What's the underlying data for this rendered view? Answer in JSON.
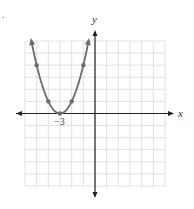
{
  "problem_marker": ".",
  "chart_data": {
    "type": "line",
    "title": "",
    "xlabel": "x",
    "ylabel": "y",
    "xlim": [
      -6,
      6
    ],
    "ylim": [
      -6,
      6
    ],
    "grid": true,
    "function": "y = (x + 3)^2",
    "vertex": {
      "x": -3,
      "y": 0,
      "label": "−3"
    },
    "series": [
      {
        "name": "parabola",
        "color": "#6b6b6b",
        "points": [
          {
            "x": -5,
            "y": 4
          },
          {
            "x": -4,
            "y": 1
          },
          {
            "x": -3,
            "y": 0
          },
          {
            "x": -2,
            "y": 1
          },
          {
            "x": -1,
            "y": 4
          }
        ],
        "arrow_ends": [
          {
            "x": -5.45,
            "y": 6
          },
          {
            "x": -0.55,
            "y": 6
          }
        ]
      }
    ],
    "tick_labels": [
      {
        "axis": "x",
        "value": -3,
        "text": "−3"
      }
    ]
  },
  "colors": {
    "grid": "#d9d9d9",
    "axis": "#222222",
    "curve": "#6b6b6b"
  }
}
